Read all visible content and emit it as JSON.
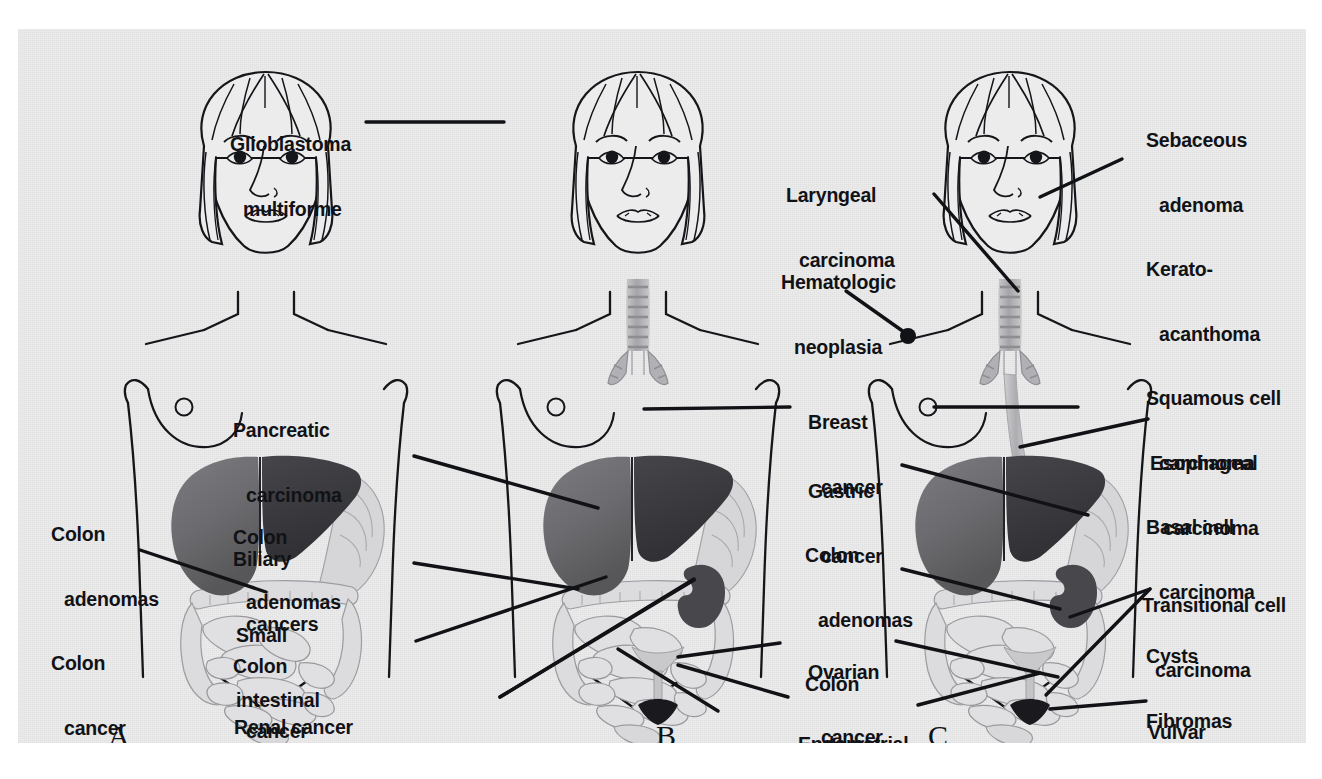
{
  "figure": {
    "panels": [
      {
        "id": "A",
        "letter": "A"
      },
      {
        "id": "B",
        "letter": "B"
      },
      {
        "id": "C",
        "letter": "C"
      }
    ]
  },
  "labels": {
    "panelA": [
      {
        "name": "colon-adenomas-colon-cancer-a",
        "lines": [
          "Colon",
          "adenomas",
          "Colon",
          "cancer"
        ],
        "indent": [
          0,
          1,
          0,
          1
        ]
      }
    ],
    "panelB": [
      {
        "name": "glioblastoma-multiforme",
        "lines": [
          "Glioblastoma",
          "multiforme"
        ],
        "indent": [
          0,
          1
        ]
      },
      {
        "name": "pancreatic-carcinoma-biliary-cancers",
        "lines": [
          "Pancreatic",
          "carcinoma",
          "Biliary",
          "cancers"
        ],
        "indent": [
          0,
          1,
          0,
          1
        ]
      },
      {
        "name": "colon-adenomas-colon-cancer-b",
        "lines": [
          "Colon",
          "adenomas",
          "Colon",
          "cancer"
        ],
        "indent": [
          0,
          1,
          0,
          1
        ]
      },
      {
        "name": "small-intestinal-cancers",
        "lines": [
          "Small",
          "intestinal",
          "cancers"
        ],
        "indent": [
          0,
          0,
          0
        ]
      },
      {
        "name": "renal-cancer-ureteral-carcinomas",
        "lines": [
          "Renal cancer",
          "Ureteral",
          "carcinomas"
        ],
        "indent": [
          0,
          0,
          1
        ]
      }
    ],
    "panelC": [
      {
        "name": "laryngeal-carcinoma",
        "lines": [
          "Laryngeal",
          "carcinoma"
        ],
        "indent": [
          0,
          1
        ]
      },
      {
        "name": "hematologic-neoplasia",
        "lines": [
          "Hematologic",
          "neoplasia"
        ],
        "indent": [
          0,
          1
        ]
      },
      {
        "name": "breast-cancer",
        "lines": [
          "Breast",
          "cancer"
        ],
        "indent": [
          0,
          1
        ]
      },
      {
        "name": "gastric-cancer",
        "lines": [
          "Gastric",
          "cancer"
        ],
        "indent": [
          0,
          1
        ]
      },
      {
        "name": "colon-adenomas-colon-cancer-c",
        "lines": [
          "Colon",
          "adenomas",
          "Colon",
          "cancer"
        ],
        "indent": [
          0,
          1,
          0,
          1
        ]
      },
      {
        "name": "ovarian-cancer",
        "lines": [
          "Ovarian",
          "cancer"
        ],
        "indent": [
          0,
          1
        ]
      },
      {
        "name": "endometrial-carcinoma",
        "lines": [
          "Endometrial",
          "carcinoma"
        ],
        "indent": [
          0,
          1
        ]
      },
      {
        "name": "skin-lesions-list",
        "lines": [
          "Sebaceous",
          "adenoma",
          "Kerato-",
          "acanthoma",
          "Squamous cell",
          "carcinoma",
          "Basal cell",
          "carcinoma",
          "Cysts",
          "Fibromas"
        ],
        "indent": [
          0,
          1,
          0,
          1,
          0,
          1,
          0,
          1,
          0,
          0
        ]
      },
      {
        "name": "esophageal-carcinoma",
        "lines": [
          "Esophageal",
          "carcinoma"
        ],
        "indent": [
          0,
          1
        ]
      },
      {
        "name": "transitional-cell-carcinoma",
        "lines": [
          "Transitional cell",
          "carcinoma"
        ],
        "indent": [
          0,
          1
        ]
      },
      {
        "name": "vulvar-carcinoma",
        "lines": [
          "Vulvar",
          "carcinoma"
        ],
        "indent": [
          0,
          1
        ]
      }
    ]
  },
  "text": {
    "colon_adenomas_a_l1": "Colon",
    "colon_adenomas_a_l2": "adenomas",
    "colon_adenomas_a_l3": "Colon",
    "colon_adenomas_a_l4": "cancer",
    "glioblastoma_l1": "Glioblastoma",
    "glioblastoma_l2": "multiforme",
    "pancreatic_l1": "Pancreatic",
    "pancreatic_l2": "carcinoma",
    "pancreatic_l3": "Biliary",
    "pancreatic_l4": "cancers",
    "colon_b_l1": "Colon",
    "colon_b_l2": "adenomas",
    "colon_b_l3": "Colon",
    "colon_b_l4": "cancer",
    "small_intestinal_l1": "Small",
    "small_intestinal_l2": "intestinal",
    "small_intestinal_l3": "cancers",
    "renal_l1": "Renal cancer",
    "renal_l2": "Ureteral",
    "renal_l3": "carcinomas",
    "laryngeal_l1": "Laryngeal",
    "laryngeal_l2": "carcinoma",
    "hematologic_l1": "Hematologic",
    "hematologic_l2": "neoplasia",
    "breast_l1": "Breast",
    "breast_l2": "cancer",
    "gastric_l1": "Gastric",
    "gastric_l2": "cancer",
    "colon_c_l1": "Colon",
    "colon_c_l2": "adenomas",
    "colon_c_l3": "Colon",
    "colon_c_l4": "cancer",
    "ovarian_l1": "Ovarian",
    "ovarian_l2": "cancer",
    "endometrial_l1": "Endometrial",
    "endometrial_l2": "carcinoma",
    "skin_l1": "Sebaceous",
    "skin_l2": "adenoma",
    "skin_l3": "Kerato-",
    "skin_l4": "acanthoma",
    "skin_l5": "Squamous cell",
    "skin_l6": "carcinoma",
    "skin_l7": "Basal cell",
    "skin_l8": "carcinoma",
    "skin_l9": "Cysts",
    "skin_l10": "Fibromas",
    "esophageal_l1": "Esophageal",
    "esophageal_l2": "carcinoma",
    "transitional_l1": "Transitional cell",
    "transitional_l2": "carcinoma",
    "vulvar_l1": "Vulvar",
    "vulvar_l2": "carcinoma",
    "letter_a": "A",
    "letter_b": "B",
    "letter_c": "C"
  },
  "colors": {
    "plate_background": "#ececed",
    "ink": "#111216",
    "liver_left": "#6f6f72",
    "liver_right": "#3a3a3e",
    "bowel_light": "#d2d2d4",
    "bowel_line": "#8a8a8e",
    "kidney": "#4a4a4e",
    "trachea": "#b5b5b8",
    "page_background": "#ffffff"
  }
}
